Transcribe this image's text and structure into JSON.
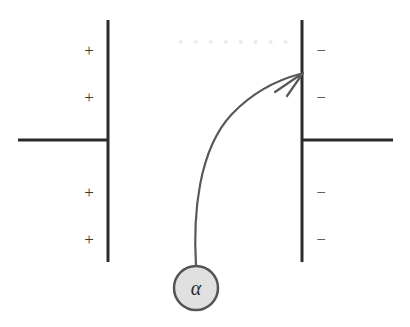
{
  "figure": {
    "type": "physics-diagram",
    "background_color": "#ffffff",
    "line_color": "#2b2b2b",
    "trajectory_color": "#595959",
    "particle_fill": "#e0e0e0",
    "particle_stroke": "#555555",
    "label_color": "#3a3a3a"
  },
  "left_plate": {
    "name": "positive-plate",
    "polarity": "positive",
    "x": 108,
    "y_top": 20,
    "y_bottom": 262,
    "thickness": 3,
    "lead_wire": {
      "x_start": 18,
      "x_end": 108,
      "y": 140,
      "thickness": 3
    },
    "charges": [
      {
        "symbol": "+",
        "x": 89,
        "y": 50
      },
      {
        "symbol": "+",
        "x": 89,
        "y": 97
      },
      {
        "symbol": "+",
        "x": 89,
        "y": 192
      },
      {
        "symbol": "+",
        "x": 89,
        "y": 239
      }
    ]
  },
  "right_plate": {
    "name": "negative-plate",
    "polarity": "negative",
    "x": 302,
    "y_top": 20,
    "y_bottom": 262,
    "thickness": 3,
    "lead_wire": {
      "x_start": 302,
      "x_end": 393,
      "y": 140,
      "thickness": 3
    },
    "charges": [
      {
        "symbol": "−",
        "x": 321,
        "y": 50
      },
      {
        "symbol": "−",
        "x": 321,
        "y": 97
      },
      {
        "symbol": "−",
        "x": 321,
        "y": 192
      },
      {
        "symbol": "−",
        "x": 321,
        "y": 239
      }
    ]
  },
  "particle": {
    "name": "alpha-particle",
    "label": "α",
    "center_x": 196,
    "center_y": 288,
    "radius": 22,
    "stroke_width": 2.5
  },
  "trajectory": {
    "name": "alpha-particle-path",
    "description": "curved deflection path from alpha particle toward negative plate",
    "stroke_width": 2.2,
    "path": "M 196 266 C 193 215 198 150 232 114 C 256 89 281 79 300 74",
    "arrow": {
      "tip_x": 303,
      "tip_y": 73,
      "style": "open-v",
      "stroke_width": 2.2,
      "path": "M 275 92 L 303 73 M 287 96 L 303 73"
    }
  },
  "ghost_artifact": {
    "name": "scan-bleed-through",
    "text": "• • • • • • • •",
    "x": 178,
    "y": 34,
    "visible": true
  }
}
